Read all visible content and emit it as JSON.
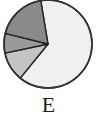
{
  "chart_data": {
    "type": "pie",
    "title": "",
    "label": "E",
    "start_angle_deg": -9.5,
    "direction": "clockwise",
    "slices": [
      {
        "name": "slice-1",
        "value": 63.5,
        "color": "#f0f0f0"
      },
      {
        "name": "slice-2",
        "value": 10.8,
        "color": "#c4c4c4"
      },
      {
        "name": "slice-3",
        "value": 7.2,
        "color": "#9a9a9a"
      },
      {
        "name": "slice-4",
        "value": 18.5,
        "color": "#8a8a8a"
      }
    ],
    "legend": "none"
  },
  "caption": "E"
}
